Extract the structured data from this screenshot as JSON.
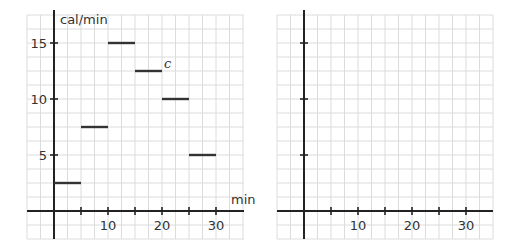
{
  "chart_data": [
    {
      "type": "line",
      "subtype": "step-segments",
      "title": "",
      "xlabel": "min",
      "ylabel": "cal/min",
      "xlim": [
        -5,
        35
      ],
      "ylim": [
        -5,
        35
      ],
      "x_ticks": [
        5,
        10,
        15,
        20,
        25,
        30
      ],
      "x_tick_labels": [
        "10",
        "20",
        "30"
      ],
      "y_ticks": [
        5,
        10,
        15
      ],
      "y_tick_labels": [
        "5",
        "10",
        "15"
      ],
      "grid": true,
      "series": [
        {
          "name": "c",
          "segments": [
            {
              "x0": 0,
              "x1": 5,
              "y": 2.5
            },
            {
              "x0": 5,
              "x1": 10,
              "y": 7.5
            },
            {
              "x0": 10,
              "x1": 15,
              "y": 15
            },
            {
              "x0": 15,
              "x1": 20,
              "y": 12.5
            },
            {
              "x0": 20,
              "x1": 25,
              "y": 10
            },
            {
              "x0": 25,
              "x1": 30,
              "y": 5
            }
          ]
        }
      ],
      "annotations": [
        {
          "text": "c",
          "x": 20,
          "y": 12.5
        }
      ]
    },
    {
      "type": "line",
      "subtype": "blank-axes",
      "title": "",
      "xlabel": "",
      "ylabel": "",
      "x_ticks": [
        5,
        10,
        15,
        20,
        25,
        30
      ],
      "x_tick_labels": [
        "10",
        "20",
        "30"
      ],
      "y_ticks": [
        5,
        10,
        15
      ],
      "y_tick_labels": [],
      "grid": true,
      "series": []
    }
  ],
  "left": {
    "ylabel": "cal/min",
    "xlabel": "min",
    "curve_label": "c",
    "y_labels": [
      "15",
      "10",
      "5"
    ],
    "x_labels": [
      "10",
      "20",
      "30"
    ]
  },
  "right": {
    "x_labels": [
      "10",
      "20",
      "30"
    ]
  }
}
